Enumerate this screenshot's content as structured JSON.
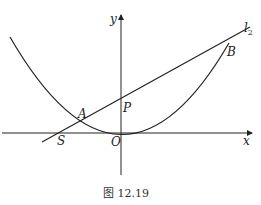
{
  "figure": {
    "caption": "图 12.19",
    "labels": {
      "y_axis": "y",
      "x_axis": "x",
      "line": "l",
      "line_sub": "2",
      "point_A": "A",
      "point_B": "B",
      "point_P": "P",
      "point_S": "S",
      "origin": "O"
    }
  },
  "colors": {
    "stroke": "#222222",
    "background": "#ffffff"
  }
}
